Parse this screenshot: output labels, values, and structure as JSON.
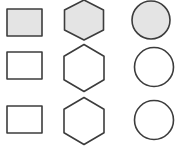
{
  "diagram": {
    "layout": "3x3 grid",
    "columns": [
      "rectangle",
      "hexagon",
      "circle"
    ],
    "colors": {
      "stroke": "#3c3c3c",
      "filled": "#e4e4e4",
      "empty": "#ffffff",
      "background": "#ffffff"
    },
    "rows": [
      {
        "filled": true,
        "shapes": [
          {
            "type": "rectangle",
            "x": 7,
            "y": 9,
            "w": 35,
            "h": 27
          },
          {
            "type": "hexagon",
            "cx": 84,
            "cy": 20,
            "rx": 19.5,
            "ry": 20
          },
          {
            "type": "circle",
            "cx": 151,
            "cy": 20,
            "r": 19
          }
        ]
      },
      {
        "filled": false,
        "shapes": [
          {
            "type": "rectangle",
            "x": 7,
            "y": 52,
            "w": 35,
            "h": 27
          },
          {
            "type": "hexagon",
            "cx": 84,
            "cy": 68,
            "rx": 20,
            "ry": 23.5
          },
          {
            "type": "circle",
            "cx": 154,
            "cy": 67,
            "r": 19.5
          }
        ]
      },
      {
        "filled": false,
        "shapes": [
          {
            "type": "rectangle",
            "x": 7,
            "y": 106,
            "w": 35,
            "h": 27
          },
          {
            "type": "hexagon",
            "cx": 84,
            "cy": 121,
            "rx": 20,
            "ry": 23.5
          },
          {
            "type": "circle",
            "cx": 154,
            "cy": 120,
            "r": 19.5
          }
        ]
      }
    ]
  }
}
